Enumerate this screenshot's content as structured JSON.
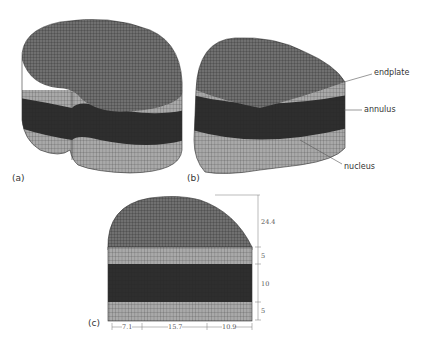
{
  "figure": {
    "panels": [
      {
        "id": "a",
        "label": "(a)",
        "description": "full disc finite element mesh"
      },
      {
        "id": "b",
        "label": "(b)",
        "description": "half disc cut view",
        "annotations": [
          {
            "text": "endplate"
          },
          {
            "text": "annulus"
          },
          {
            "text": "nucleus"
          }
        ]
      },
      {
        "id": "c",
        "label": "(c)",
        "description": "dimensioned half disc",
        "vertical_dims": [
          "24.4",
          "5",
          "10",
          "5"
        ],
        "horizontal_dims": [
          "7.1",
          "15.7",
          "10.9"
        ]
      }
    ],
    "colors": {
      "mesh_top": "#6e6e6e",
      "endplate_band": "#a9a9a9",
      "annulus_band": "#2e2e2e",
      "mesh_line": "#1e1e1e",
      "background": "#ffffff"
    }
  }
}
